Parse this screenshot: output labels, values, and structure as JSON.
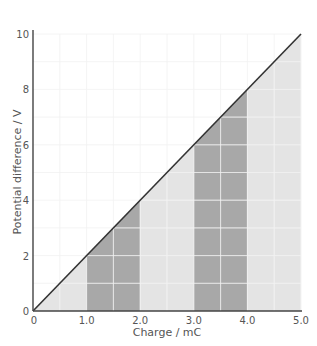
{
  "chart_data": {
    "type": "area",
    "title": "",
    "xlabel": "Charge / mC",
    "ylabel": "Potential difference / V",
    "xlim": [
      0,
      5.0
    ],
    "ylim": [
      0,
      10
    ],
    "grid": true,
    "x_ticks": [
      0,
      1.0,
      2.0,
      3.0,
      4.0,
      5.0
    ],
    "x_tick_labels": [
      "0",
      "1.0",
      "2.0",
      "3.0",
      "4.0",
      "5.0"
    ],
    "y_ticks": [
      0,
      2,
      4,
      6,
      8,
      10
    ],
    "y_tick_labels": [
      "0",
      "2",
      "4",
      "6",
      "8",
      "10"
    ],
    "x_grid_step": 0.5,
    "y_grid_step": 1,
    "series": [
      {
        "name": "V vs Q line",
        "x": [
          0,
          5.0
        ],
        "y": [
          0,
          10
        ],
        "color": "#333333"
      }
    ],
    "shaded_regions": [
      {
        "x0": 0.0,
        "x1": 1.0,
        "shade": "light"
      },
      {
        "x0": 1.0,
        "x1": 2.0,
        "shade": "dark"
      },
      {
        "x0": 2.0,
        "x1": 3.0,
        "shade": "light"
      },
      {
        "x0": 3.0,
        "x1": 4.0,
        "shade": "dark"
      },
      {
        "x0": 4.0,
        "x1": 5.0,
        "shade": "light"
      }
    ],
    "colors": {
      "light": "#e4e4e4",
      "dark": "#a8a8a8",
      "grid": "#ececec",
      "axis": "#444444",
      "line": "#333333"
    }
  }
}
